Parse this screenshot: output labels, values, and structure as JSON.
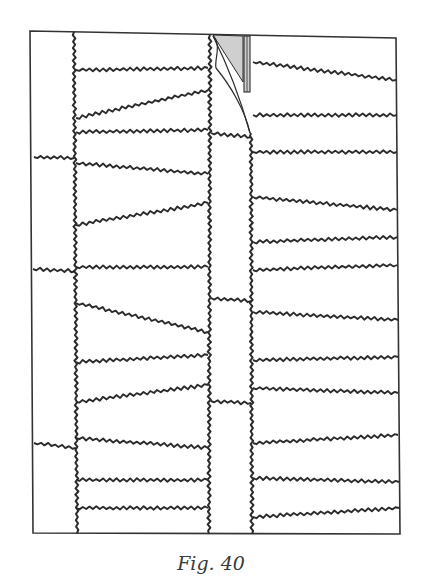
{
  "caption": "Fig. 40",
  "colors": {
    "ink": "#2b2b2b",
    "frame": "#333333",
    "shade": "#cfcfcf",
    "background": "#ffffff"
  },
  "diagram": {
    "frame": {
      "tl": [
        30,
        31
      ],
      "tr": [
        396,
        38
      ],
      "br": [
        400,
        534
      ],
      "bl": [
        33,
        533
      ]
    },
    "vertical_seams": [
      {
        "name": "left-seam",
        "x_top": 74,
        "x_bottom": 77,
        "y_top": 32,
        "y_bottom": 533
      },
      {
        "name": "middle-left-seam",
        "x_top": 210,
        "x_bottom": 209,
        "y_top": 35,
        "y_bottom": 534
      },
      {
        "name": "middle-right-seam",
        "x_top": 251,
        "x_bottom": 252,
        "y_top": 133,
        "y_bottom": 534
      }
    ],
    "far_left_lines": [
      {
        "x1": 34,
        "y1": 157,
        "x2": 74,
        "y2": 158
      },
      {
        "x1": 33,
        "y1": 269,
        "x2": 75,
        "y2": 271
      },
      {
        "x1": 34,
        "y1": 443,
        "x2": 76,
        "y2": 448
      }
    ],
    "left_section_lines": [
      {
        "x1": 76,
        "y1": 70,
        "x2": 208,
        "y2": 68
      },
      {
        "x1": 76,
        "y1": 118,
        "x2": 208,
        "y2": 90
      },
      {
        "x1": 76,
        "y1": 132,
        "x2": 208,
        "y2": 130
      },
      {
        "x1": 76,
        "y1": 163,
        "x2": 208,
        "y2": 174
      },
      {
        "x1": 76,
        "y1": 225,
        "x2": 208,
        "y2": 203
      },
      {
        "x1": 76,
        "y1": 267,
        "x2": 208,
        "y2": 267
      },
      {
        "x1": 76,
        "y1": 303,
        "x2": 208,
        "y2": 332
      },
      {
        "x1": 76,
        "y1": 362,
        "x2": 208,
        "y2": 355
      },
      {
        "x1": 76,
        "y1": 402,
        "x2": 208,
        "y2": 385
      },
      {
        "x1": 76,
        "y1": 438,
        "x2": 208,
        "y2": 448
      },
      {
        "x1": 76,
        "y1": 480,
        "x2": 208,
        "y2": 480
      },
      {
        "x1": 76,
        "y1": 508,
        "x2": 208,
        "y2": 508
      }
    ],
    "middle_strip_lines": [
      {
        "x1": 211,
        "y1": 133,
        "x2": 251,
        "y2": 137
      },
      {
        "x1": 211,
        "y1": 298,
        "x2": 251,
        "y2": 301
      },
      {
        "x1": 211,
        "y1": 401,
        "x2": 251,
        "y2": 403
      }
    ],
    "right_section_lines": [
      {
        "x1": 253,
        "y1": 62,
        "x2": 396,
        "y2": 80
      },
      {
        "x1": 253,
        "y1": 115,
        "x2": 397,
        "y2": 115
      },
      {
        "x1": 253,
        "y1": 152,
        "x2": 397,
        "y2": 152
      },
      {
        "x1": 253,
        "y1": 197,
        "x2": 397,
        "y2": 210
      },
      {
        "x1": 253,
        "y1": 242,
        "x2": 397,
        "y2": 237
      },
      {
        "x1": 253,
        "y1": 270,
        "x2": 397,
        "y2": 265
      },
      {
        "x1": 253,
        "y1": 312,
        "x2": 398,
        "y2": 320
      },
      {
        "x1": 253,
        "y1": 360,
        "x2": 398,
        "y2": 357
      },
      {
        "x1": 253,
        "y1": 388,
        "x2": 398,
        "y2": 393
      },
      {
        "x1": 253,
        "y1": 443,
        "x2": 398,
        "y2": 435
      },
      {
        "x1": 253,
        "y1": 478,
        "x2": 399,
        "y2": 482
      },
      {
        "x1": 253,
        "y1": 517,
        "x2": 399,
        "y2": 508
      }
    ],
    "flap": {
      "shaded_triangle": [
        [
          213,
          35
        ],
        [
          243,
          36
        ],
        [
          243,
          82
        ]
      ],
      "double_bar": {
        "x1": 244,
        "x2": 250,
        "y_top": 36,
        "y_bottom": 92
      },
      "curl_outer": "M 213 36 C 225 60, 238 90, 250 133",
      "curl_inner": "M 213 36 C 222 45, 214 60, 216 68 C 230 85, 245 110, 250 133"
    }
  }
}
